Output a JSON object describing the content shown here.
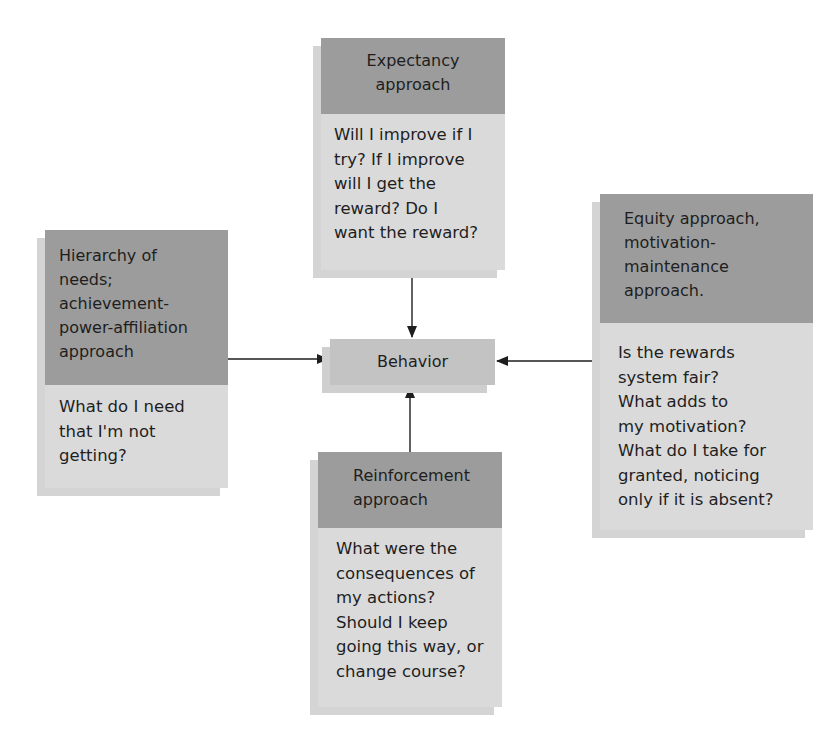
{
  "diagram": {
    "center": {
      "label": "Behavior"
    },
    "nodes": [
      {
        "id": "expectancy",
        "title_lines": [
          "Expectancy",
          "approach"
        ],
        "question_lines": [
          "Will I improve if I",
          "try? If I improve",
          "will I get the",
          "reward? Do I",
          "want the reward?"
        ],
        "position": "top"
      },
      {
        "id": "hierarchy",
        "title_lines": [
          "Hierarchy of",
          "needs;",
          "achievement-",
          "power-affiliation",
          "approach"
        ],
        "question_lines": [
          "What do I need",
          "that I'm not",
          "getting?"
        ],
        "position": "left"
      },
      {
        "id": "equity",
        "title_lines": [
          "Equity approach,",
          "motivation-",
          "maintenance",
          "approach."
        ],
        "question_lines": [
          "Is the rewards",
          "system fair?",
          "What adds to",
          "my motivation?",
          "What do I take for",
          "granted, noticing",
          "only if it is absent?"
        ],
        "position": "right"
      },
      {
        "id": "reinforcement",
        "title_lines": [
          "Reinforcement",
          "approach"
        ],
        "question_lines": [
          "What were the",
          "consequences of",
          "my actions?",
          "Should I keep",
          "going this way, or",
          "change course?"
        ],
        "position": "bottom"
      }
    ],
    "edges": [
      {
        "from": "expectancy",
        "to": "Behavior"
      },
      {
        "from": "hierarchy",
        "to": "Behavior"
      },
      {
        "from": "equity",
        "to": "Behavior"
      },
      {
        "from": "reinforcement",
        "to": "Behavior"
      }
    ],
    "colors": {
      "header": "#9c9c9c",
      "body": "#dadada",
      "center": "#c3c3c3",
      "shadow": "#d4d4d4",
      "line": "#1e1e1e"
    }
  }
}
